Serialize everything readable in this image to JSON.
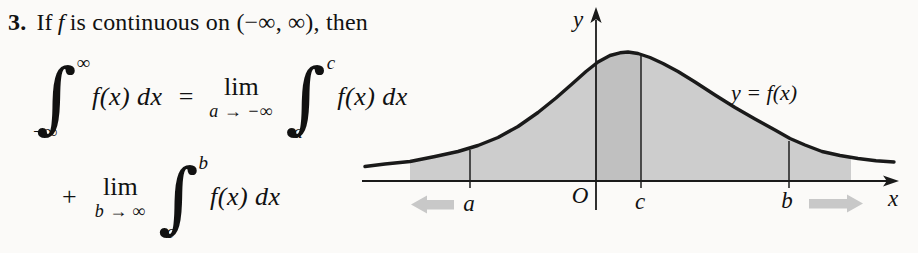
{
  "problem": {
    "number": "3.",
    "statement": {
      "if": "If",
      "f": "f",
      "rest": "is continuous on (−∞, ∞), then"
    }
  },
  "formula": {
    "integral_glyph": "∫",
    "line1": {
      "int1": {
        "sup": "∞",
        "sub": "−∞"
      },
      "integrand1": "f(x) dx",
      "equals": "=",
      "lim": "lim",
      "lim_under": "a → −∞",
      "int2": {
        "sup": "c",
        "sub": "a"
      },
      "integrand2": "f(x) dx"
    },
    "line2": {
      "plus": "+",
      "lim": "lim",
      "lim_under": "b → ∞",
      "int": {
        "sup": "b",
        "sub": "c"
      },
      "integrand": "f(x) dx"
    }
  },
  "figure": {
    "labels": {
      "y_axis": "y",
      "x_axis": "x",
      "origin": "O",
      "a": "a",
      "c": "c",
      "b": "b",
      "curve": "y = f(x)"
    },
    "colors": {
      "shade": "#cdcdcd",
      "shade_band": "#c0c0c0",
      "curve": "#1a1a1a",
      "axis": "#1a1a1a",
      "block_arrow": "#c8c8c8",
      "background": "#fbfaf8"
    }
  }
}
